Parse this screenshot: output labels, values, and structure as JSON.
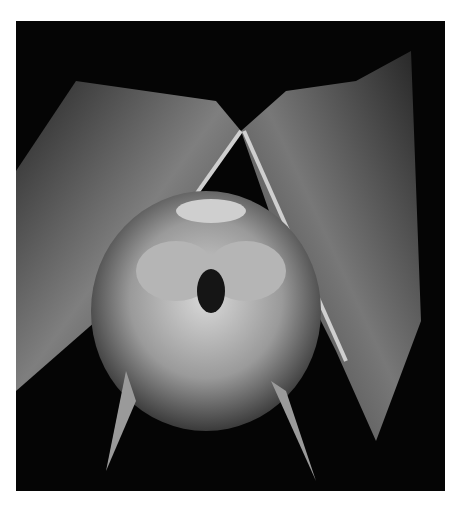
{
  "image": {
    "subject": "Bat hanging upside down with wings wrapped around body, black background",
    "colors": {
      "background": "#050505",
      "wing": "#8a8a8a",
      "fur": "#bdbdbd",
      "page": "#ffffff"
    }
  }
}
